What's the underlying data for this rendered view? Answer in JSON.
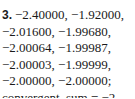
{
  "exercise": {
    "number": "3.",
    "lines": [
      "−2.40000, −1.92000,",
      "−2.01600, −1.99680,",
      "−2.00064, −1.99987,",
      "−2.00003, −1.99999,",
      "−2.00000, −2.00000;",
      "convergent, sum = −2"
    ]
  }
}
